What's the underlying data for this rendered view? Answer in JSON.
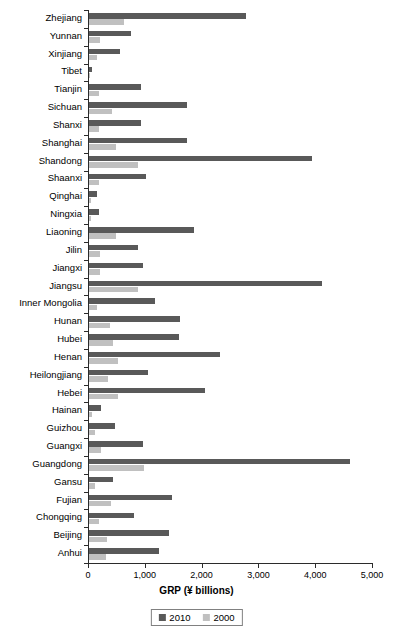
{
  "chart_data": {
    "type": "bar",
    "orientation": "horizontal",
    "title": "",
    "xlabel": "GRP (¥ billions)",
    "ylabel": "",
    "xlim": [
      0,
      5000
    ],
    "xticks": [
      0,
      1000,
      2000,
      3000,
      4000,
      5000
    ],
    "xtick_labels": [
      "0",
      "1,000",
      "2,000",
      "3,000",
      "4,000",
      "5,000"
    ],
    "grid": false,
    "legend_position": "bottom-center",
    "legend_entries": [
      "2010",
      "2000"
    ],
    "colors": {
      "2010": "#595959",
      "2000": "#c0c0c0",
      "axis": "#2b2b2b",
      "text": "#000000",
      "background": "#ffffff"
    },
    "categories": [
      "Zhejiang",
      "Yunnan",
      "Xinjiang",
      "Tibet",
      "Tianjin",
      "Sichuan",
      "Shanxi",
      "Shanghai",
      "Shandong",
      "Shaanxi",
      "Qinghai",
      "Ningxia",
      "Liaoning",
      "Jilin",
      "Jiangxi",
      "Jiangsu",
      "Inner Mongolia",
      "Hunan",
      "Hubei",
      "Henan",
      "Heilongjiang",
      "Hebei",
      "Hainan",
      "Guizhou",
      "Guangxi",
      "Guangdong",
      "Gansu",
      "Fujian",
      "Chongqing",
      "Beijing",
      "Anhui"
    ],
    "series": [
      {
        "name": "2010",
        "color": "#595959",
        "values": [
          2770,
          740,
          540,
          50,
          915,
          1720,
          920,
          1720,
          3930,
          1010,
          135,
          170,
          1850,
          870,
          945,
          4100,
          1160,
          1600,
          1580,
          2310,
          1040,
          2040,
          205,
          460,
          950,
          4600,
          430,
          1470,
          790,
          1410,
          1240
        ]
      },
      {
        "name": "2000",
        "color": "#c0c0c0",
        "values": [
          620,
          200,
          140,
          12,
          180,
          400,
          170,
          480,
          860,
          170,
          27,
          27,
          470,
          190,
          200,
          860,
          140,
          370,
          430,
          510,
          330,
          510,
          52,
          100,
          205,
          970,
          100,
          390,
          180,
          320,
          300
        ]
      }
    ]
  },
  "axis": {
    "x_title": "GRP (¥ billions)"
  },
  "legend": {
    "items": [
      {
        "label": "2010",
        "color": "#595959"
      },
      {
        "label": "2000",
        "color": "#c0c0c0"
      }
    ]
  }
}
